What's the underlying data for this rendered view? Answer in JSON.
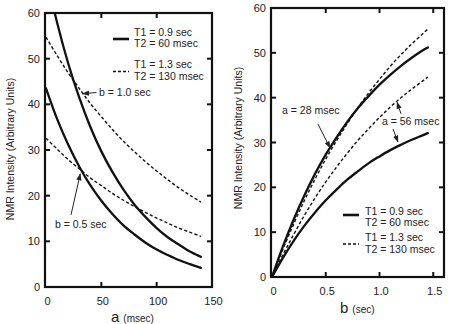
{
  "chart_data": [
    {
      "type": "line",
      "panel": "left",
      "title": "",
      "xlabel": "a (msec)",
      "xlabel_var": "a",
      "xlabel_unit": "(msec)",
      "ylabel": "NMR Intensity (Arbitrary Units)",
      "xlim": [
        0,
        150
      ],
      "ylim": [
        0,
        60
      ],
      "xticks": [
        0,
        50,
        100,
        150
      ],
      "xtick_labels": [
        "0",
        "50",
        "100",
        "150"
      ],
      "yticks": [
        0,
        10,
        20,
        30,
        40,
        50,
        60
      ],
      "ytick_labels": [
        "0",
        "10",
        "20",
        "30",
        "40",
        "50",
        "60"
      ],
      "grid": false,
      "legend_position": "upper right",
      "legend": [
        {
          "style": "solid",
          "line1": "T1 = 0.9 sec",
          "line2": "T2 = 60 msec"
        },
        {
          "style": "dashed",
          "line1": "T1 = 1.3 sec",
          "line2": "T2 = 130 msec"
        }
      ],
      "x": [
        0,
        10,
        20,
        30,
        40,
        50,
        60,
        70,
        80,
        90,
        100,
        110,
        120,
        130,
        140
      ],
      "series": [
        {
          "name": "T1 = 0.9 sec, T2 = 60 msec (b = 1.0 sec)",
          "style": "solid",
          "values": [
            68.4,
            57.9,
            49.0,
            41.5,
            35.1,
            29.7,
            25.2,
            21.3,
            18.0,
            15.3,
            12.9,
            10.9,
            9.3,
            7.8,
            6.6
          ]
        },
        {
          "name": "T1 = 1.3 sec, T2 = 130 msec (b = 1.0 sec)",
          "style": "dashed",
          "values": [
            54.7,
            50.7,
            46.9,
            43.5,
            40.2,
            37.3,
            34.5,
            31.9,
            29.6,
            27.4,
            25.4,
            23.5,
            21.7,
            20.1,
            18.6
          ]
        },
        {
          "name": "T1 = 0.9 sec, T2 = 60 msec (b = 0.5 sec)",
          "style": "solid",
          "values": [
            43.5,
            36.8,
            31.2,
            26.4,
            22.3,
            18.9,
            16.0,
            13.5,
            11.5,
            9.7,
            8.2,
            7.0,
            5.9,
            5.0,
            4.2
          ]
        },
        {
          "name": "T1 = 1.3 sec, T2 = 130 msec (b = 0.5 sec)",
          "style": "dashed",
          "values": [
            32.6,
            30.2,
            27.9,
            25.9,
            23.9,
            22.2,
            20.5,
            19.0,
            17.6,
            16.3,
            15.1,
            14.0,
            12.9,
            12.0,
            11.1
          ]
        }
      ],
      "annotations": [
        {
          "text": "b = 1.0 sec",
          "label_at": [
            47.9,
            41.9
          ],
          "arrows": [
            {
              "from": [
                45.6,
                42.6
              ],
              "to": [
                33.0,
                42.3
              ]
            }
          ]
        },
        {
          "text": "b = 0.5 sec",
          "label_at": [
            8.1,
            13.0
          ],
          "arrows": [
            {
              "from": [
                22.6,
                15.8
              ],
              "to": [
                31.0,
                24.8
              ]
            }
          ]
        }
      ]
    },
    {
      "type": "line",
      "panel": "right",
      "title": "",
      "xlabel": "b (sec)",
      "xlabel_var": "b",
      "xlabel_unit": "(sec)",
      "ylabel": "NMR Intensity (Arbitrary Units)",
      "xlim": [
        0,
        1.6
      ],
      "ylim": [
        0,
        60
      ],
      "xticks": [
        0,
        0.5,
        1.0,
        1.5
      ],
      "xtick_labels": [
        "0",
        "0.5",
        "1.0",
        "1.5"
      ],
      "yticks": [
        0,
        10,
        20,
        30,
        40,
        50,
        60
      ],
      "ytick_labels": [
        "0",
        "10",
        "20",
        "30",
        "40",
        "50",
        "60"
      ],
      "grid": false,
      "legend_position": "lower right",
      "legend": [
        {
          "style": "solid",
          "line1": "T1 = 0.9 sec",
          "line2": "T2 = 60 msec"
        },
        {
          "style": "dashed",
          "line1": "T1 = 1.3 sec",
          "line2": "T2 = 130 msec"
        }
      ],
      "x": [
        0,
        0.1,
        0.2,
        0.3,
        0.4,
        0.5,
        0.6,
        0.7,
        0.8,
        0.9,
        1.0,
        1.1,
        1.2,
        1.3,
        1.4,
        1.45
      ],
      "series": [
        {
          "name": "T1 = 0.9 sec, T2 = 60 msec (a = 28 msec)",
          "style": "solid",
          "values": [
            0,
            6.7,
            12.7,
            18.1,
            23.0,
            27.3,
            31.1,
            34.6,
            37.7,
            40.4,
            42.9,
            45.1,
            47.1,
            48.9,
            50.5,
            51.2
          ]
        },
        {
          "name": "T1 = 1.3 sec, T2 = 130 msec (a = 28 msec)",
          "style": "dashed",
          "values": [
            0,
            6.1,
            11.7,
            17.0,
            21.8,
            26.3,
            30.4,
            34.2,
            37.8,
            41.1,
            44.1,
            47.0,
            49.6,
            52.0,
            54.2,
            55.3
          ]
        },
        {
          "name": "T1 = 0.9 sec, T2 = 60 msec (a = 56 msec)",
          "style": "solid",
          "values": [
            0,
            4.2,
            8.0,
            11.4,
            14.4,
            17.1,
            19.5,
            21.7,
            23.6,
            25.4,
            26.9,
            28.3,
            29.5,
            30.6,
            31.6,
            32.1
          ]
        },
        {
          "name": "T1 = 1.3 sec, T2 = 130 msec (a = 56 msec)",
          "style": "dashed",
          "values": [
            0,
            4.9,
            9.4,
            13.7,
            17.6,
            21.2,
            24.5,
            27.6,
            30.5,
            33.1,
            35.6,
            37.9,
            40.0,
            41.9,
            43.7,
            44.6
          ]
        }
      ],
      "annotations": [
        {
          "text": "a = 28 msec",
          "label_at": [
            0.093,
            36.4
          ],
          "arrows": [
            {
              "from": [
                0.428,
                34.1
              ],
              "to": [
                0.54,
                28.8
              ]
            }
          ]
        },
        {
          "text": "a = 56 msec",
          "label_at": [
            1.023,
            34.0
          ],
          "arrows": [
            {
              "from": [
                1.2,
                36.4
              ],
              "to": [
                1.163,
                39.0
              ]
            },
            {
              "from": [
                1.126,
                33.0
              ],
              "to": [
                1.172,
                30.1
              ]
            }
          ]
        }
      ]
    }
  ]
}
